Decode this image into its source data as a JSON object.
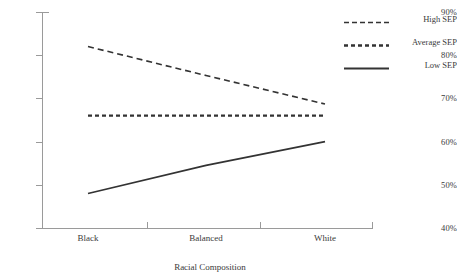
{
  "chart_data": {
    "type": "line",
    "title": "",
    "xlabel": "Racial Composition",
    "ylabel": "",
    "categories": [
      "Black",
      "Balanced",
      "White"
    ],
    "ylim": [
      40,
      90
    ],
    "yticks": [
      40,
      50,
      60,
      70,
      80,
      90
    ],
    "ytick_labels": [
      "40%",
      "50%",
      "60%",
      "70%",
      "80%",
      "90%"
    ],
    "grid": false,
    "legend_position": "right",
    "series": [
      {
        "name": "High SEP",
        "values": [
          82.0,
          75.3,
          68.7
        ],
        "style": "dashed",
        "color": "#333333"
      },
      {
        "name": "Average SEP",
        "values": [
          66.0,
          66.0,
          66.0
        ],
        "style": "dotted",
        "color": "#333333"
      },
      {
        "name": "Low SEP",
        "values": [
          48.0,
          54.5,
          60.0
        ],
        "style": "solid",
        "color": "#333333"
      }
    ]
  },
  "axes": {
    "x_title": "Racial Composition",
    "x_labels": [
      "Black",
      "Balanced",
      "White"
    ],
    "y_labels": [
      "90%",
      "80%",
      "70%",
      "60%",
      "50%",
      "40%"
    ]
  },
  "legend": {
    "items": [
      {
        "label": "High SEP",
        "style": "dashed"
      },
      {
        "label": "Average SEP",
        "style": "dotted"
      },
      {
        "label": "Low SEP",
        "style": "solid"
      }
    ]
  },
  "colors": {
    "line": "#333333",
    "axis": "#9a9a9a",
    "text": "#3a3a3a",
    "background": "#ffffff"
  }
}
